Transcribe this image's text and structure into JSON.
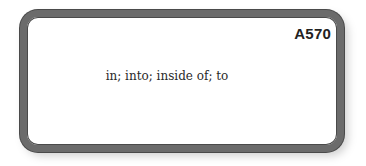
{
  "card": {
    "id": "A570",
    "definition": "in; into; inside of; to",
    "colors": {
      "border": "#6b6b6b",
      "background": "#ffffff",
      "text": "#2a2a2a"
    }
  }
}
